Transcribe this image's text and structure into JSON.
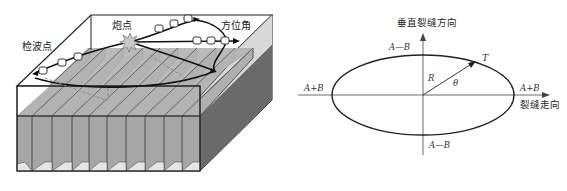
{
  "left_diagram": {
    "labels": {
      "receiver_point": "检波点",
      "shot_point": "炮点",
      "azimuth": "方位角"
    },
    "fracture_plates_count": 10,
    "colors": {
      "plate_gray": "#a8a8a8",
      "plate_top": "#bdbdbd",
      "side_face": "#6e6e6e",
      "outline": "#222222"
    }
  },
  "right_diagram": {
    "axis_labels": {
      "vertical": "垂直裂缝方向",
      "horizontal": "裂缝走向"
    },
    "ellipse_labels": {
      "top": "A—B",
      "bottom": "A—B",
      "left": "A+B",
      "right": "A+B"
    },
    "vector_labels": {
      "radius": "R",
      "angle": "θ",
      "tip": "T"
    }
  }
}
